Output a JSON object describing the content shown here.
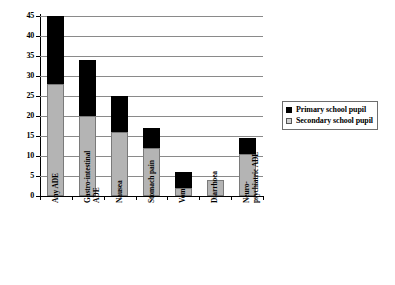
{
  "chart_data": {
    "type": "bar",
    "subtype": "stacked-vertical",
    "title": "",
    "xlabel": "",
    "ylabel": "",
    "ylim": [
      0,
      45
    ],
    "ytick_step": 5,
    "yticks": [
      0,
      5,
      10,
      15,
      20,
      25,
      30,
      35,
      40,
      45
    ],
    "ytick_labels": [
      "0",
      "5",
      "10",
      "15",
      "20",
      "25",
      "30",
      "35",
      "40",
      "45"
    ],
    "grid": "horizontal",
    "legend_position": "right",
    "categories": [
      "Any ADE",
      "Gastro-intestinal\nADE",
      "Nausea",
      "Stomach pain",
      "Vomiting",
      "Diarrhoea",
      "Neuro-\npsychiatric ADE"
    ],
    "series": [
      {
        "name": "Secondary school pupil",
        "color": "#b4b4b4",
        "values": [
          28,
          20,
          16,
          12,
          2,
          4,
          10.5
        ]
      },
      {
        "name": "Primary school pupil",
        "color": "#000000",
        "values": [
          17,
          14,
          9,
          5,
          4,
          0,
          4
        ]
      }
    ],
    "totals": [
      45,
      34,
      25,
      17,
      6,
      4,
      14.5
    ]
  },
  "legend": {
    "entries": [
      {
        "label": "Primary school pupil",
        "swatch": "black-filled-square"
      },
      {
        "label": "Secondary school pupil",
        "swatch": "light-gray-square"
      }
    ]
  }
}
